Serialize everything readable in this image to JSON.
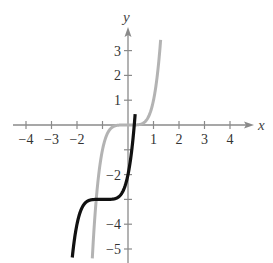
{
  "chart_data": {
    "type": "line",
    "title": "",
    "xlabel": "x",
    "ylabel": "y",
    "xlim": [
      -4.5,
      4.8
    ],
    "ylim": [
      -5.5,
      3.8
    ],
    "grid": false,
    "legend": null,
    "x_ticks": [
      -4,
      -3,
      -2,
      -1,
      1,
      2,
      3,
      4
    ],
    "x_tick_labels": [
      "−4",
      "−3",
      "−2",
      "",
      "1",
      "2",
      "3",
      "4"
    ],
    "y_ticks": [
      3,
      2,
      1,
      -1,
      -2,
      -3,
      -4,
      -5
    ],
    "y_tick_labels": [
      "3",
      "2",
      "1",
      "",
      "−2",
      "",
      "−4",
      "−5"
    ],
    "series": [
      {
        "name": "y = x^5",
        "color": "#b3b3b3",
        "function": "x^5",
        "x": [
          -1.4,
          -1.3,
          -1.2,
          -1.1,
          -1.0,
          -0.8,
          -0.6,
          -0.4,
          -0.2,
          0,
          0.2,
          0.4,
          0.6,
          0.8,
          1.0,
          1.1,
          1.2,
          1.28
        ],
        "y": [
          -5.38,
          -3.71,
          -2.49,
          -1.61,
          -1.0,
          -0.33,
          -0.08,
          -0.01,
          0,
          0,
          0,
          0.01,
          0.08,
          0.33,
          1.0,
          1.61,
          2.49,
          3.44
        ]
      },
      {
        "name": "y = (x+1)^5 - 3",
        "color": "#111111",
        "function": "(x+1)^5 - 3",
        "x": [
          -2.4,
          -2.3,
          -2.2,
          -2.1,
          -2.0,
          -1.8,
          -1.6,
          -1.4,
          -1.2,
          -1.0,
          -0.8,
          -0.6,
          -0.4,
          -0.2,
          0,
          0.1,
          0.2,
          0.28
        ],
        "y": [
          -5.38,
          -3.71,
          -5.49,
          -4.61,
          -4.0,
          -3.33,
          -3.08,
          -3.01,
          -3.0,
          -3.0,
          -3.0,
          -2.99,
          -2.92,
          -2.67,
          -2.0,
          -1.39,
          -0.51,
          0.44
        ]
      }
    ]
  },
  "axes": {
    "x_label": "x",
    "y_label": "y"
  }
}
